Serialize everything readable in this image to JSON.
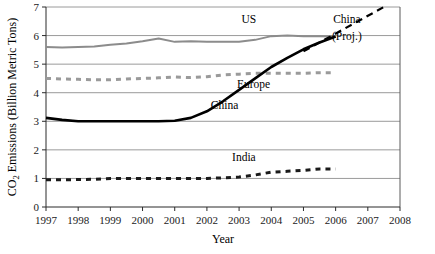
{
  "chart_data": {
    "type": "line",
    "title": "",
    "xlabel": "Year",
    "ylabel": "CO2 Emissions (Billion Metric Tons)",
    "ylabel_parts": {
      "prefix": "CO",
      "sub": "2",
      "suffix": " Emissions (Billion Metric Tons)"
    },
    "xlim": [
      1997,
      2008
    ],
    "ylim": [
      0,
      7
    ],
    "grid": "horizontal",
    "legend": "inline-annotations",
    "x_ticks": [
      "1997",
      "1998",
      "1999",
      "2000",
      "2001",
      "2002",
      "2003",
      "2004",
      "2005",
      "2006",
      "2007",
      "2008"
    ],
    "y_ticks": [
      "0",
      "1",
      "2",
      "3",
      "4",
      "5",
      "6",
      "7"
    ],
    "x": [
      1997,
      1997.5,
      1998,
      1998.5,
      1999,
      1999.5,
      2000,
      2000.5,
      2001,
      2001.5,
      2002,
      2002.5,
      2003,
      2003.5,
      2004,
      2004.5,
      2005,
      2005.5,
      2006
    ],
    "series": [
      {
        "name": "US",
        "color": "#8c8c8c",
        "style": "solid",
        "width": 2,
        "label": "US",
        "label_x": 2003.3,
        "label_y": 6.45,
        "values": [
          5.6,
          5.58,
          5.6,
          5.62,
          5.68,
          5.72,
          5.8,
          5.9,
          5.78,
          5.8,
          5.78,
          5.78,
          5.78,
          5.85,
          5.98,
          6.0,
          5.98,
          5.98,
          5.97
        ]
      },
      {
        "name": "Europe",
        "color": "#9a9a9a",
        "style": "dashed",
        "width": 3,
        "label": "Europe",
        "label_x": 2003.45,
        "label_y": 4.18,
        "values": [
          4.5,
          4.48,
          4.47,
          4.45,
          4.45,
          4.48,
          4.5,
          4.52,
          4.55,
          4.53,
          4.56,
          4.62,
          4.65,
          4.68,
          4.68,
          4.68,
          4.68,
          4.7,
          4.7
        ]
      },
      {
        "name": "China",
        "color": "#000000",
        "style": "solid",
        "width": 2.6,
        "label": "China",
        "label_x": 2002.55,
        "label_y": 3.42,
        "values": [
          3.12,
          3.05,
          3.0,
          3.0,
          3.0,
          3.0,
          3.0,
          3.0,
          3.02,
          3.12,
          3.35,
          3.7,
          4.1,
          4.5,
          4.9,
          5.22,
          5.52,
          5.76,
          5.97
        ]
      },
      {
        "name": "China (Proj.)",
        "color": "#000000",
        "style": "dashed",
        "width": 2.2,
        "label_line1": "China",
        "label_line2": "(Proj.)",
        "label_x": 2006.35,
        "label_y1": 6.45,
        "label_y2": 5.85,
        "x": [
          2005.0,
          2007.5
        ],
        "values": [
          5.45,
          7.0
        ]
      },
      {
        "name": "India",
        "color": "#1a1a1a",
        "style": "dashed",
        "width": 3,
        "label": "India",
        "label_x": 2003.15,
        "label_y": 1.62,
        "values": [
          0.95,
          0.95,
          0.96,
          0.97,
          1.0,
          1.0,
          1.0,
          1.0,
          1.0,
          1.0,
          1.0,
          1.02,
          1.05,
          1.12,
          1.22,
          1.25,
          1.28,
          1.33,
          1.33
        ]
      }
    ]
  }
}
